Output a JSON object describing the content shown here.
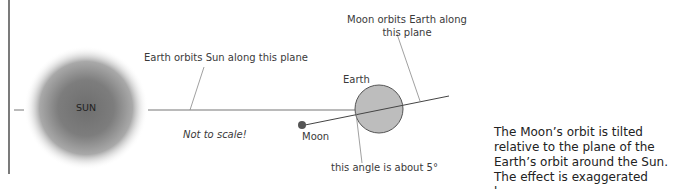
{
  "diagram": {
    "sun_label": "SUN",
    "earth_label": "Earth",
    "moon_label": "Moon",
    "earth_plane_label": "Earth orbits Sun along this plane",
    "moon_plane_label_line1": "Moon orbits Earth along",
    "moon_plane_label_line2": "this plane",
    "scale_note": "Not to scale!",
    "angle_label": "this angle is about 5°",
    "caption": "The Moon’s orbit is tilted relative to the plane of the Earth’s orbit around the Sun. The effect is exaggerated here.",
    "colors": {
      "sun_core": "#6f6f6f",
      "earth_fill": "#bdbdbd",
      "moon_fill": "#555555",
      "line": "#555555"
    }
  }
}
